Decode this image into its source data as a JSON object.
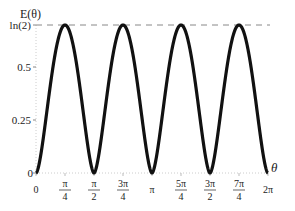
{
  "chart_data": {
    "type": "line",
    "title": "",
    "xlabel": "θ",
    "ylabel": "E(θ)",
    "xlim": [
      0,
      6.2832
    ],
    "ylim": [
      0,
      0.6931
    ],
    "x_ticks": [
      {
        "num": "0",
        "den": ""
      },
      {
        "num": "π",
        "den": "4"
      },
      {
        "num": "π",
        "den": "2"
      },
      {
        "num": "3π",
        "den": "4"
      },
      {
        "num": "π",
        "den": ""
      },
      {
        "num": "5π",
        "den": "4"
      },
      {
        "num": "3π",
        "den": "2"
      },
      {
        "num": "7π",
        "den": "4"
      },
      {
        "num": "2π",
        "den": ""
      }
    ],
    "y_ticks": [
      "0",
      "0.25",
      "0.5",
      "ln(2)"
    ],
    "reference_line": {
      "y": 0.6931,
      "label": "ln(2)",
      "style": "dashed"
    },
    "series": [
      {
        "name": "E(θ)",
        "function": "-cos²θ·ln(cos²θ) - sin²θ·ln(sin²θ)",
        "x": [
          0,
          0.3927,
          0.7854,
          1.1781,
          1.5708,
          1.9635,
          2.3562,
          2.7489,
          3.1416,
          3.5343,
          3.927,
          4.3197,
          4.7124,
          5.1051,
          5.4978,
          5.8905,
          6.2832
        ],
        "values": [
          0,
          0.417,
          0.693,
          0.417,
          0,
          0.417,
          0.693,
          0.417,
          0,
          0.417,
          0.693,
          0.417,
          0,
          0.417,
          0.693,
          0.417,
          0
        ]
      }
    ],
    "grid": false,
    "legend": "none"
  },
  "labels": {
    "ylabel": "E(θ)",
    "xlabel": "θ",
    "y0": "0",
    "y025": "0.25",
    "y05": "0.5",
    "yln2": "ln(2)"
  }
}
